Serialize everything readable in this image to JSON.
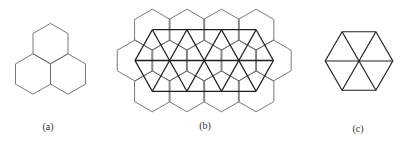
{
  "figure": {
    "panels": [
      {
        "id": "a",
        "label": "(a)",
        "label_pos": [
          48,
          126
        ],
        "description": "three hexagons meeting at a common vertex",
        "hexagons": {
          "orientation": "pointy-top",
          "radius": 20.2,
          "centers": [
            [
              50.5,
              43.6
            ],
            [
              33,
              74
            ],
            [
              68,
              74
            ]
          ]
        }
      },
      {
        "id": "b",
        "label": "(b)",
        "label_pos": [
          205,
          125
        ],
        "description": "hexagonal tiling with overlaid triangular lattice connecting hexagon centers",
        "hexagons": {
          "orientation": "pointy-top",
          "radius": 20.5,
          "rows": [
            {
              "y": 29.7,
              "x": [
                152.3,
                186.9,
                221.5,
                256.1
              ]
            },
            {
              "y": 60.5,
              "x": [
                135.0,
                169.6,
                204.2,
                238.8,
                273.4
              ]
            },
            {
              "y": 91.3,
              "x": [
                152.3,
                186.9,
                221.5,
                256.1
              ]
            }
          ]
        },
        "lattice": {
          "description": "thick lines joining neighboring hexagon centers (triangular lattice)"
        }
      },
      {
        "id": "c",
        "label": "(c)",
        "label_pos": [
          358,
          128
        ],
        "description": "flat-top hexagon subdivided into six equilateral triangles",
        "hexagon": {
          "orientation": "flat-top",
          "center": [
            359,
            61
          ],
          "radius": 33.8
        }
      }
    ],
    "colors": {
      "hex_thin": "#6a6a6a",
      "lattice_thick": "#1e1e1e",
      "label": "#333333"
    }
  }
}
